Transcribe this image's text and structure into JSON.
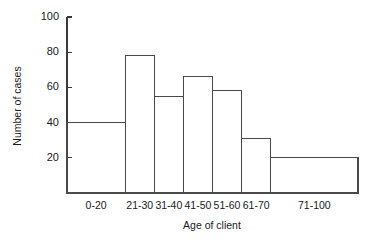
{
  "chart_data": {
    "type": "bar",
    "title": "",
    "subtitle": "",
    "xlabel": "Age of client",
    "ylabel": "Number of cases",
    "categories": [
      "0-20",
      "21-30",
      "31-40",
      "41-50",
      "51-60",
      "61-70",
      "71-100"
    ],
    "values": [
      40,
      78,
      55,
      66,
      58,
      31,
      20
    ],
    "bin_edges": [
      0,
      20,
      30,
      40,
      50,
      60,
      70,
      100
    ],
    "ylim": [
      0,
      100
    ],
    "yticks": [
      20,
      40,
      60,
      80,
      100
    ],
    "ytick_labels": [
      "20",
      "40",
      "60",
      "80",
      "100"
    ],
    "grid": false,
    "legend": null,
    "legend_position": "none",
    "style": "histogram-unequal-bins",
    "annotations": []
  },
  "axes": {
    "y_title": "Number of cases",
    "x_title": "Age of client"
  },
  "colors": {
    "background": "#ffffff",
    "axis": "#3a3a3a",
    "bar_stroke": "#4a4a4a",
    "bar_fill": "none",
    "text": "#1a1a1a"
  }
}
